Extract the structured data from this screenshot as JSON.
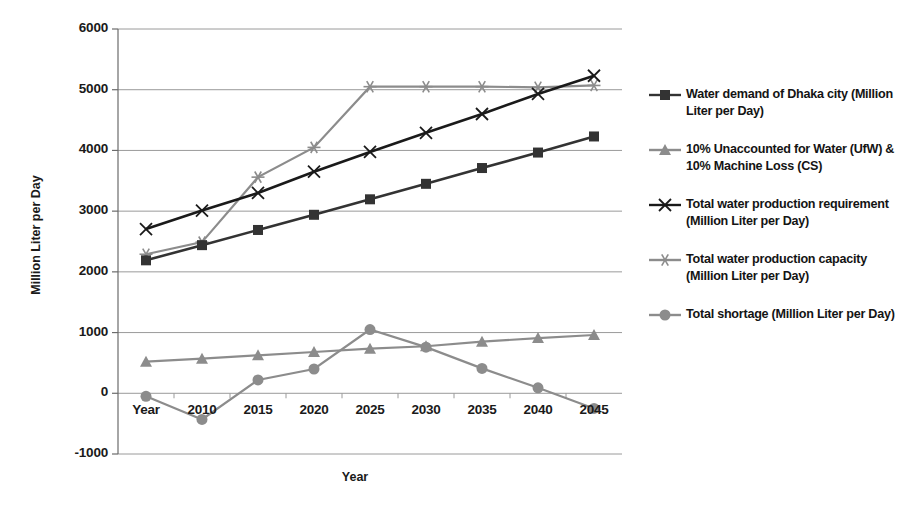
{
  "chart_data": {
    "type": "line",
    "title": "",
    "xlabel": "Year",
    "ylabel": "Million Liter per Day",
    "categories": [
      "Year",
      "2010",
      "2015",
      "2020",
      "2025",
      "2030",
      "2035",
      "2040",
      "2045"
    ],
    "ylim": [
      -1000,
      6000
    ],
    "yticks": [
      -1000,
      0,
      1000,
      2000,
      3000,
      4000,
      5000,
      6000
    ],
    "grid": true,
    "legend_position": "right",
    "series": [
      {
        "name": "Water demand of Dhaka city (Million Liter  per Day)",
        "marker": "square",
        "color": "#333333",
        "values": [
          2190,
          2440,
          2690,
          2940,
          3195,
          3450,
          3710,
          3965,
          4230
        ]
      },
      {
        "name": "10% Unaccounted for Water (UfW) & 10% Machine Loss (CS)",
        "marker": "triangle",
        "color": "#8c8c8c",
        "values": [
          520,
          570,
          625,
          680,
          735,
          775,
          850,
          910,
          960
        ]
      },
      {
        "name": "Total water production requirement (Million Liter per Day)",
        "marker": "x",
        "color": "#1a1a1a",
        "values": [
          2705,
          3010,
          3300,
          3650,
          3975,
          4290,
          4600,
          4930,
          5230
        ]
      },
      {
        "name": "Total water production capacity (Million Liter per Day)",
        "marker": "asterisk",
        "color": "#8c8c8c",
        "values": [
          2290,
          2490,
          3560,
          4050,
          5050,
          5050,
          5050,
          5040,
          5070
        ]
      },
      {
        "name": "Total shortage (Million Liter per Day)",
        "marker": "circle",
        "color": "#8c8c8c",
        "values": [
          -50,
          -430,
          220,
          400,
          1050,
          760,
          410,
          90,
          -250
        ]
      }
    ]
  }
}
